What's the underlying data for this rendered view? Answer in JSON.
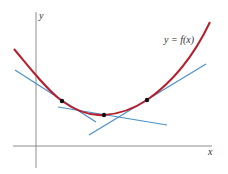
{
  "diagram": {
    "title": "",
    "axes": {
      "x_label": "x",
      "y_label": "y",
      "color": "#8c8c8c"
    },
    "curve": {
      "label": "y = f(x)",
      "color": "#b5202e",
      "description": "convex curve with minimum near center"
    },
    "points": [
      {
        "name": "point-1",
        "cx": 62,
        "cy": 101
      },
      {
        "name": "point-2",
        "cx": 104,
        "cy": 115
      },
      {
        "name": "point-3",
        "cx": 147,
        "cy": 100
      }
    ],
    "tangent_lines": [
      {
        "name": "tangent-1",
        "x1": 15,
        "y1": 70,
        "x2": 96,
        "y2": 122
      },
      {
        "name": "tangent-2",
        "x1": 58,
        "y1": 107,
        "x2": 167,
        "y2": 125
      },
      {
        "name": "tangent-3",
        "x1": 89,
        "y1": 135,
        "x2": 206,
        "y2": 64
      }
    ],
    "tangent_color": "#4a90c8",
    "point_color": "#111111"
  }
}
